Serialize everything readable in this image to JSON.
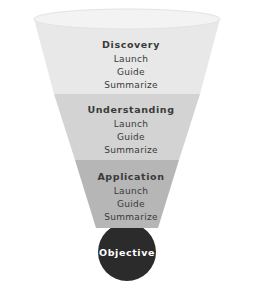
{
  "diagram": {
    "type": "funnel",
    "title": "",
    "background_color": "#ffffff",
    "text_color": "#3a3a3a",
    "stages": [
      {
        "label": "Discovery",
        "fill_color": "#e7e8e7",
        "steps": [
          "Launch",
          "Guide",
          "Summarize"
        ]
      },
      {
        "label": "Understanding",
        "fill_color": "#d2d3d2",
        "steps": [
          "Launch",
          "Guide",
          "Summarize"
        ]
      },
      {
        "label": "Application",
        "fill_color": "#b5b6b5",
        "steps": [
          "Launch",
          "Guide",
          "Summarize"
        ]
      }
    ],
    "outcome": {
      "label": "Objective",
      "fill_color": "#2b2b2b",
      "text_color": "#ffffff"
    },
    "rim": {
      "fill_color": "#f2f3f2",
      "edge_color": "#e2e3e2"
    }
  }
}
